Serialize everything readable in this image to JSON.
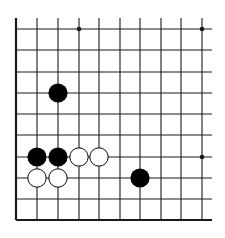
{
  "board": {
    "description": "Go board diagram fragment (lower-left corner region), 10x10 visible intersections, open on top and right",
    "columns_x": [
      16,
      37,
      58,
      79,
      99,
      120,
      140,
      161,
      181,
      202
    ],
    "rows_y": [
      29,
      50,
      72,
      93,
      114,
      135,
      157,
      178,
      199,
      220
    ],
    "line_top": 18,
    "line_right": 212,
    "edges": [
      "left",
      "bottom"
    ],
    "star_points": [
      [
        3,
        0
      ],
      [
        9,
        0
      ],
      [
        9,
        6
      ]
    ],
    "stones": [
      {
        "color": "black",
        "col": 2,
        "row": 3
      },
      {
        "color": "black",
        "col": 1,
        "row": 6
      },
      {
        "color": "black",
        "col": 2,
        "row": 6
      },
      {
        "color": "white",
        "col": 3,
        "row": 6
      },
      {
        "color": "white",
        "col": 4,
        "row": 6
      },
      {
        "color": "white",
        "col": 1,
        "row": 7
      },
      {
        "color": "white",
        "col": 2,
        "row": 7
      },
      {
        "color": "black",
        "col": 6,
        "row": 7
      }
    ],
    "colors": {
      "line": "#1a1a1a",
      "black_stone": "#000000",
      "white_stone": "#ffffff",
      "background": "#ffffff"
    }
  }
}
